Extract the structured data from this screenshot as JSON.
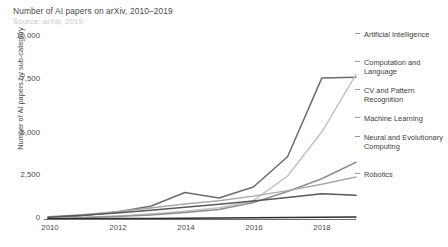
{
  "header": {
    "title": "Number of AI papers on arXiv, 2010–2019",
    "source": "Source: arXiv, 2019."
  },
  "axes": {
    "ylabel": "Number of AI papers by sub-category",
    "yticks": [
      "0",
      "2,500",
      "5,000",
      "7,500",
      "10,000"
    ],
    "xticks": [
      "2010",
      "2012",
      "2014",
      "2016",
      "2018"
    ]
  },
  "legend": {
    "items": [
      {
        "label": "Artificial Intelligence",
        "color": "#6b6b6b"
      },
      {
        "label": "Computation and Language",
        "color": "#c2c2c2"
      },
      {
        "label": "CV and Pattern Recognition",
        "color": "#8f8f8f"
      },
      {
        "label": "Machine Learning",
        "color": "#a8a8a8"
      },
      {
        "label": "Neural and Evolutionary Computing",
        "color": "#595959"
      },
      {
        "label": "Robotics",
        "color": "#2e2e2e"
      }
    ]
  },
  "chart_data": {
    "type": "line",
    "title": "Number of AI papers on arXiv, 2010–2019",
    "subtitle": "Source: arXiv, 2019.",
    "xlabel": "",
    "ylabel": "Number of AI papers by sub-category",
    "x": [
      2010,
      2011,
      2012,
      2013,
      2014,
      2015,
      2016,
      2017,
      2018,
      2019
    ],
    "xlim": [
      2010,
      2019
    ],
    "ylim": [
      0,
      10000
    ],
    "yticks": [
      0,
      2500,
      5000,
      7500,
      10000
    ],
    "xticks": [
      2010,
      2012,
      2014,
      2016,
      2018
    ],
    "grid": false,
    "legend_position": "right",
    "series": [
      {
        "name": "Artificial Intelligence",
        "color": "#6b6b6b",
        "values": [
          60,
          180,
          380,
          700,
          1450,
          1150,
          1750,
          3400,
          7700,
          7750
        ]
      },
      {
        "name": "Computation and Language",
        "color": "#c2c2c2",
        "values": [
          40,
          90,
          170,
          280,
          430,
          620,
          1000,
          2350,
          4750,
          7900
        ]
      },
      {
        "name": "CV and Pattern Recognition",
        "color": "#8f8f8f",
        "values": [
          30,
          70,
          130,
          220,
          350,
          520,
          900,
          1500,
          2200,
          3100
        ]
      },
      {
        "name": "Machine Learning",
        "color": "#a8a8a8",
        "values": [
          120,
          230,
          400,
          600,
          820,
          1000,
          1250,
          1550,
          1900,
          2300
        ]
      },
      {
        "name": "Neural and Evolutionary Computing",
        "color": "#595959",
        "values": [
          100,
          200,
          330,
          480,
          640,
          800,
          980,
          1180,
          1380,
          1300
        ]
      },
      {
        "name": "Robotics",
        "color": "#2e2e2e",
        "values": [
          10,
          15,
          22,
          30,
          40,
          55,
          70,
          85,
          100,
          110
        ]
      }
    ]
  }
}
